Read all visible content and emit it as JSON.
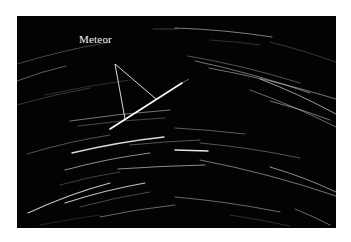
{
  "figure": {
    "background": "#ffffff",
    "photo_background": "#030303",
    "annotation": {
      "label": "Meteor",
      "color": "#f0f0f0",
      "apex": [
        115,
        64
      ],
      "targets": [
        [
          125,
          119
        ],
        [
          156,
          99
        ]
      ]
    },
    "meteor": {
      "from": [
        110,
        129
      ],
      "to": [
        182,
        83
      ],
      "tail_to": [
        189,
        79
      ],
      "color": "#ffffff"
    },
    "star_trails": [
      {
        "from": [
          17,
          64
        ],
        "to": [
          110,
          42
        ],
        "bend": -3,
        "opacity": 0.35,
        "width": 0.8
      },
      {
        "from": [
          17,
          81
        ],
        "to": [
          66,
          66
        ],
        "bend": -2,
        "opacity": 0.45,
        "width": 0.8
      },
      {
        "from": [
          17,
          105
        ],
        "to": [
          90,
          88
        ],
        "bend": -2,
        "opacity": 0.3,
        "width": 0.7
      },
      {
        "from": [
          45,
          95
        ],
        "to": [
          130,
          80
        ],
        "bend": -2,
        "opacity": 0.25,
        "width": 0.7
      },
      {
        "from": [
          70,
          121
        ],
        "to": [
          170,
          110
        ],
        "bend": -2,
        "opacity": 0.5,
        "width": 0.9
      },
      {
        "from": [
          78,
          126
        ],
        "to": [
          165,
          118
        ],
        "bend": -2,
        "opacity": 0.35,
        "width": 0.8
      },
      {
        "from": [
          153,
          29
        ],
        "to": [
          177,
          29
        ],
        "bend": 0,
        "opacity": 0.35,
        "width": 0.7
      },
      {
        "from": [
          175,
          28
        ],
        "to": [
          272,
          37
        ],
        "bend": -3,
        "opacity": 0.55,
        "width": 0.9
      },
      {
        "from": [
          188,
          56
        ],
        "to": [
          300,
          83
        ],
        "bend": -4,
        "opacity": 0.4,
        "width": 0.8
      },
      {
        "from": [
          195,
          61
        ],
        "to": [
          310,
          93
        ],
        "bend": -4,
        "opacity": 0.5,
        "width": 0.9
      },
      {
        "from": [
          209,
          68
        ],
        "to": [
          336,
          99
        ],
        "bend": -4,
        "opacity": 0.5,
        "width": 0.9
      },
      {
        "from": [
          260,
          79
        ],
        "to": [
          336,
          114
        ],
        "bend": -3,
        "opacity": 0.6,
        "width": 1.0
      },
      {
        "from": [
          250,
          90
        ],
        "to": [
          336,
          127
        ],
        "bend": -3,
        "opacity": 0.45,
        "width": 0.9
      },
      {
        "from": [
          270,
          101
        ],
        "to": [
          330,
          120
        ],
        "bend": -2,
        "opacity": 0.5,
        "width": 0.9
      },
      {
        "from": [
          270,
          42
        ],
        "to": [
          336,
          62
        ],
        "bend": -2,
        "opacity": 0.3,
        "width": 0.7
      },
      {
        "from": [
          210,
          40
        ],
        "to": [
          260,
          45
        ],
        "bend": -1,
        "opacity": 0.25,
        "width": 0.7
      },
      {
        "from": [
          27,
          154
        ],
        "to": [
          110,
          135
        ],
        "bend": -3,
        "opacity": 0.4,
        "width": 0.8
      },
      {
        "from": [
          72,
          153
        ],
        "to": [
          164,
          137
        ],
        "bend": -3,
        "opacity": 0.85,
        "width": 1.3
      },
      {
        "from": [
          130,
          145
        ],
        "to": [
          200,
          140
        ],
        "bend": -1,
        "opacity": 0.4,
        "width": 0.8
      },
      {
        "from": [
          65,
          170
        ],
        "to": [
          150,
          153
        ],
        "bend": -3,
        "opacity": 0.55,
        "width": 1.0
      },
      {
        "from": [
          118,
          169
        ],
        "to": [
          205,
          165
        ],
        "bend": -1,
        "opacity": 0.55,
        "width": 1.0
      },
      {
        "from": [
          60,
          185
        ],
        "to": [
          120,
          172
        ],
        "bend": -2,
        "opacity": 0.3,
        "width": 0.8
      },
      {
        "from": [
          28,
          213
        ],
        "to": [
          110,
          183
        ],
        "bend": -4,
        "opacity": 0.75,
        "width": 1.2
      },
      {
        "from": [
          65,
          203
        ],
        "to": [
          145,
          183
        ],
        "bend": -3,
        "opacity": 0.75,
        "width": 1.2
      },
      {
        "from": [
          80,
          207
        ],
        "to": [
          150,
          192
        ],
        "bend": -2,
        "opacity": 0.35,
        "width": 0.8
      },
      {
        "from": [
          100,
          217
        ],
        "to": [
          175,
          205
        ],
        "bend": -2,
        "opacity": 0.45,
        "width": 0.9
      },
      {
        "from": [
          175,
          128
        ],
        "to": [
          245,
          134
        ],
        "bend": -1,
        "opacity": 0.45,
        "width": 0.8
      },
      {
        "from": [
          175,
          147
        ],
        "to": [
          207,
          166
        ],
        "bend": 0,
        "opacity": 0.0,
        "width": 0.0
      },
      {
        "from": [
          175,
          150
        ],
        "to": [
          208,
          151
        ],
        "bend": 0,
        "opacity": 0.9,
        "width": 1.4
      },
      {
        "from": [
          200,
          160
        ],
        "to": [
          336,
          196
        ],
        "bend": -5,
        "opacity": 0.5,
        "width": 0.9
      },
      {
        "from": [
          270,
          167
        ],
        "to": [
          336,
          192
        ],
        "bend": -3,
        "opacity": 0.55,
        "width": 1.0
      },
      {
        "from": [
          200,
          143
        ],
        "to": [
          300,
          158
        ],
        "bend": -3,
        "opacity": 0.4,
        "width": 0.8
      },
      {
        "from": [
          175,
          197
        ],
        "to": [
          280,
          212
        ],
        "bend": -3,
        "opacity": 0.45,
        "width": 0.9
      },
      {
        "from": [
          295,
          209
        ],
        "to": [
          330,
          225
        ],
        "bend": -1,
        "opacity": 0.45,
        "width": 0.9
      },
      {
        "from": [
          230,
          215
        ],
        "to": [
          290,
          226
        ],
        "bend": -1,
        "opacity": 0.25,
        "width": 0.7
      },
      {
        "from": [
          40,
          225
        ],
        "to": [
          100,
          215
        ],
        "bend": -1,
        "opacity": 0.2,
        "width": 0.7
      }
    ]
  }
}
